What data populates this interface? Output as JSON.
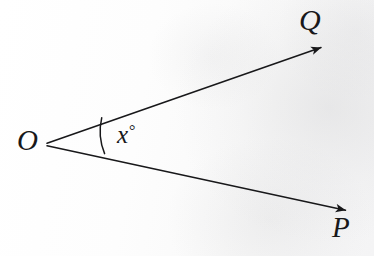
{
  "figure": {
    "type": "geometry-angle-diagram",
    "background_color": "#fdfdfc",
    "ink_color": "#18181a",
    "vertex": {
      "label": "O",
      "x": 46,
      "y": 144
    },
    "rays": [
      {
        "name": "ray-OQ",
        "endpoint_label": "Q",
        "from": {
          "x": 46,
          "y": 143
        },
        "to": {
          "x": 327,
          "y": 45
        },
        "arrowhead": true,
        "angle_degrees": -19.2
      },
      {
        "name": "ray-OP",
        "endpoint_label": "P",
        "from": {
          "x": 46,
          "y": 146
        },
        "to": {
          "x": 352,
          "y": 212
        },
        "arrowhead": true,
        "angle_degrees": 12.2
      }
    ],
    "angle_marker": {
      "label": "x",
      "degree_symbol": "°",
      "full_label": "x°",
      "arc_radius": 59,
      "arc_start": {
        "x": 102,
        "y": 118
      },
      "arc_end": {
        "x": 104,
        "y": 153
      }
    },
    "labels": {
      "vertex": "O",
      "upper_point": "Q",
      "lower_point": "P",
      "angle_value": "x",
      "angle_unit": "°"
    }
  }
}
